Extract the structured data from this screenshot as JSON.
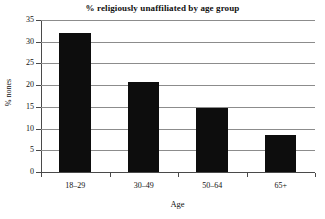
{
  "chart_data": {
    "type": "bar",
    "title": "% religiously unaffiliated by age group",
    "xlabel": "Age",
    "ylabel": "% nones",
    "categories": [
      "18–29",
      "30–49",
      "50–64",
      "65+"
    ],
    "values": [
      32.0,
      20.8,
      14.8,
      8.5
    ],
    "ylim": [
      0,
      35
    ],
    "ytick_labels": [
      "0",
      "5",
      "10",
      "15",
      "20",
      "25",
      "30",
      "35"
    ],
    "ytick_values": [
      0,
      5,
      10,
      15,
      20,
      25,
      30,
      35
    ],
    "grid": true,
    "grid_axis": "y",
    "legend": false,
    "bar_color": "#0d0d0d",
    "grid_color": "#8c8c8c",
    "axis_color": "#4a4a4a",
    "background_color": "#ffffff"
  }
}
